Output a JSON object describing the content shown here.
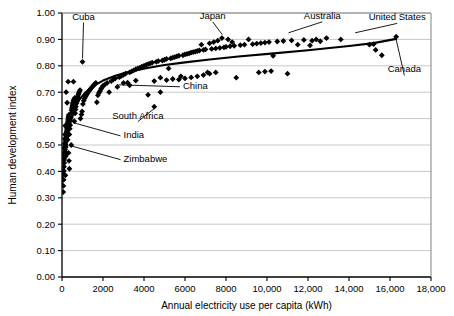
{
  "chart_data": {
    "type": "scatter",
    "title": "",
    "xlabel": "Annual electricity use per capita (kWh)",
    "ylabel": "Human development index",
    "xlim": [
      0,
      18000
    ],
    "ylim": [
      0.0,
      1.0
    ],
    "grid": true,
    "legend": null,
    "xticks": [
      "0",
      "2000",
      "4000",
      "6000",
      "8000",
      "10,000",
      "12,000",
      "14,000",
      "16,000",
      "18,000"
    ],
    "xtick_values": [
      0,
      2000,
      4000,
      6000,
      8000,
      10000,
      12000,
      14000,
      16000,
      18000
    ],
    "yticks": [
      "0.00",
      "0.10",
      "0.20",
      "0.30",
      "0.40",
      "0.50",
      "0.60",
      "0.70",
      "0.80",
      "0.90",
      "1.00"
    ],
    "ytick_values": [
      0.0,
      0.1,
      0.2,
      0.3,
      0.4,
      0.5,
      0.6,
      0.7,
      0.8,
      0.9,
      1.0
    ],
    "marker": "diamond",
    "marker_color": "#000000",
    "trend_color": "#000000",
    "grid_color": "#c8c8c8",
    "series": [
      {
        "name": "Countries",
        "points": [
          [
            60,
            0.322
          ],
          [
            70,
            0.345
          ],
          [
            80,
            0.368
          ],
          [
            75,
            0.392
          ],
          [
            90,
            0.402
          ],
          [
            100,
            0.418
          ],
          [
            110,
            0.432
          ],
          [
            95,
            0.445
          ],
          [
            120,
            0.452
          ],
          [
            130,
            0.462
          ],
          [
            105,
            0.47
          ],
          [
            140,
            0.476
          ],
          [
            150,
            0.483
          ],
          [
            115,
            0.489
          ],
          [
            160,
            0.495
          ],
          [
            170,
            0.5
          ],
          [
            125,
            0.505
          ],
          [
            180,
            0.511
          ],
          [
            190,
            0.518
          ],
          [
            135,
            0.523
          ],
          [
            200,
            0.528
          ],
          [
            210,
            0.534
          ],
          [
            145,
            0.54
          ],
          [
            220,
            0.545
          ],
          [
            230,
            0.551
          ],
          [
            240,
            0.557
          ],
          [
            250,
            0.562
          ],
          [
            260,
            0.568
          ],
          [
            155,
            0.573
          ],
          [
            270,
            0.578
          ],
          [
            280,
            0.584
          ],
          [
            290,
            0.59
          ],
          [
            300,
            0.596
          ],
          [
            310,
            0.602
          ],
          [
            320,
            0.608
          ],
          [
            330,
            0.614
          ],
          [
            165,
            0.385
          ],
          [
            175,
            0.457
          ],
          [
            185,
            0.492
          ],
          [
            195,
            0.466
          ],
          [
            450,
            0.5
          ],
          [
            600,
            0.59
          ],
          [
            360,
            0.54
          ],
          [
            380,
            0.562
          ],
          [
            400,
            0.575
          ],
          [
            420,
            0.604
          ],
          [
            440,
            0.62
          ],
          [
            460,
            0.632
          ],
          [
            480,
            0.64
          ],
          [
            500,
            0.648
          ],
          [
            520,
            0.655
          ],
          [
            540,
            0.661
          ],
          [
            560,
            0.667
          ],
          [
            580,
            0.672
          ],
          [
            620,
            0.678
          ],
          [
            640,
            0.62
          ],
          [
            660,
            0.634
          ],
          [
            680,
            0.645
          ],
          [
            700,
            0.658
          ],
          [
            720,
            0.666
          ],
          [
            740,
            0.673
          ],
          [
            760,
            0.68
          ],
          [
            780,
            0.686
          ],
          [
            800,
            0.692
          ],
          [
            820,
            0.697
          ],
          [
            850,
            0.703
          ],
          [
            880,
            0.708
          ],
          [
            560,
            0.74
          ],
          [
            300,
            0.74
          ],
          [
            1000,
            0.815
          ],
          [
            900,
            0.6
          ],
          [
            950,
            0.616
          ],
          [
            980,
            0.627
          ],
          [
            1020,
            0.655
          ],
          [
            1060,
            0.668
          ],
          [
            1100,
            0.676
          ],
          [
            1150,
            0.683
          ],
          [
            1200,
            0.69
          ],
          [
            1250,
            0.697
          ],
          [
            1300,
            0.703
          ],
          [
            1350,
            0.708
          ],
          [
            1400,
            0.713
          ],
          [
            1450,
            0.718
          ],
          [
            1500,
            0.722
          ],
          [
            1550,
            0.727
          ],
          [
            1600,
            0.731
          ],
          [
            1650,
            0.735
          ],
          [
            1700,
            0.662
          ],
          [
            1750,
            0.688
          ],
          [
            1800,
            0.697
          ],
          [
            1850,
            0.704
          ],
          [
            1900,
            0.712
          ],
          [
            1950,
            0.718
          ],
          [
            2000,
            0.724
          ],
          [
            2100,
            0.73
          ],
          [
            2200,
            0.735
          ],
          [
            2300,
            0.7
          ],
          [
            2400,
            0.742
          ],
          [
            2500,
            0.748
          ],
          [
            2600,
            0.752
          ],
          [
            2700,
            0.72
          ],
          [
            2800,
            0.757
          ],
          [
            2900,
            0.762
          ],
          [
            3000,
            0.766
          ],
          [
            3100,
            0.77
          ],
          [
            3200,
            0.736
          ],
          [
            3300,
            0.775
          ],
          [
            3400,
            0.779
          ],
          [
            3500,
            0.783
          ],
          [
            3600,
            0.787
          ],
          [
            3700,
            0.79
          ],
          [
            3800,
            0.793
          ],
          [
            3900,
            0.797
          ],
          [
            4000,
            0.8
          ],
          [
            4100,
            0.803
          ],
          [
            4200,
            0.806
          ],
          [
            4300,
            0.809
          ],
          [
            4400,
            0.812
          ],
          [
            4500,
            0.645
          ],
          [
            4600,
            0.815
          ],
          [
            4700,
            0.818
          ],
          [
            4800,
            0.755
          ],
          [
            4900,
            0.82
          ],
          [
            5000,
            0.823
          ],
          [
            5100,
            0.826
          ],
          [
            5200,
            0.79
          ],
          [
            5300,
            0.828
          ],
          [
            5400,
            0.831
          ],
          [
            5500,
            0.833
          ],
          [
            5600,
            0.836
          ],
          [
            5700,
            0.838
          ],
          [
            5800,
            0.76
          ],
          [
            5900,
            0.84
          ],
          [
            6000,
            0.843
          ],
          [
            6100,
            0.845
          ],
          [
            6200,
            0.847
          ],
          [
            6300,
            0.85
          ],
          [
            6400,
            0.852
          ],
          [
            6500,
            0.854
          ],
          [
            6600,
            0.856
          ],
          [
            6700,
            0.858
          ],
          [
            6800,
            0.88
          ],
          [
            6900,
            0.86
          ],
          [
            7000,
            0.862
          ],
          [
            7100,
            0.775
          ],
          [
            7200,
            0.885
          ],
          [
            7300,
            0.864
          ],
          [
            7400,
            0.89
          ],
          [
            7500,
            0.866
          ],
          [
            7600,
            0.895
          ],
          [
            7700,
            0.868
          ],
          [
            7800,
            0.905
          ],
          [
            7900,
            0.87
          ],
          [
            8000,
            0.872
          ],
          [
            8100,
            0.9
          ],
          [
            8200,
            0.874
          ],
          [
            8300,
            0.89
          ],
          [
            8400,
            0.876
          ],
          [
            8500,
            0.755
          ],
          [
            8700,
            0.878
          ],
          [
            8900,
            0.88
          ],
          [
            9100,
            0.9
          ],
          [
            9300,
            0.882
          ],
          [
            9500,
            0.884
          ],
          [
            9700,
            0.886
          ],
          [
            9900,
            0.888
          ],
          [
            10100,
            0.89
          ],
          [
            10300,
            0.838
          ],
          [
            10500,
            0.892
          ],
          [
            10800,
            0.894
          ],
          [
            11000,
            0.77
          ],
          [
            11200,
            0.896
          ],
          [
            11500,
            0.88
          ],
          [
            11800,
            0.898
          ],
          [
            12100,
            0.877
          ],
          [
            12400,
            0.9
          ],
          [
            4200,
            0.69
          ],
          [
            4500,
            0.742
          ],
          [
            4800,
            0.7
          ],
          [
            5100,
            0.746
          ],
          [
            5400,
            0.75
          ],
          [
            5700,
            0.748
          ],
          [
            6000,
            0.752
          ],
          [
            6300,
            0.756
          ],
          [
            6600,
            0.76
          ],
          [
            6900,
            0.765
          ],
          [
            7200,
            0.77
          ],
          [
            7500,
            0.775
          ],
          [
            3000,
            0.735
          ],
          [
            3300,
            0.726
          ],
          [
            3600,
            0.744
          ],
          [
            9600,
            0.775
          ],
          [
            9900,
            0.778
          ],
          [
            10200,
            0.78
          ],
          [
            12900,
            0.905
          ],
          [
            13600,
            0.9
          ],
          [
            15000,
            0.88
          ],
          [
            15200,
            0.882
          ],
          [
            15300,
            0.86
          ],
          [
            15600,
            0.84
          ],
          [
            16300,
            0.91
          ],
          [
            12200,
            0.895
          ],
          [
            12600,
            0.893
          ],
          [
            200,
            0.7
          ],
          [
            250,
            0.66
          ],
          [
            280,
            0.52
          ],
          [
            320,
            0.47
          ],
          [
            340,
            0.44
          ],
          [
            360,
            0.41
          ],
          [
            240,
            0.545
          ]
        ]
      }
    ],
    "trend_points": [
      [
        0,
        0.355
      ],
      [
        120,
        0.445
      ],
      [
        250,
        0.52
      ],
      [
        400,
        0.58
      ],
      [
        600,
        0.632
      ],
      [
        850,
        0.672
      ],
      [
        1150,
        0.7
      ],
      [
        1500,
        0.722
      ],
      [
        2000,
        0.744
      ],
      [
        2600,
        0.762
      ],
      [
        3300,
        0.778
      ],
      [
        4100,
        0.791
      ],
      [
        5000,
        0.803
      ],
      [
        6000,
        0.813
      ],
      [
        7200,
        0.824
      ],
      [
        8600,
        0.835
      ],
      [
        10200,
        0.846
      ],
      [
        12000,
        0.859
      ],
      [
        14000,
        0.875
      ],
      [
        15200,
        0.886
      ],
      [
        16300,
        0.902
      ]
    ],
    "annotations": [
      {
        "id": "cuba",
        "label": "Cuba",
        "text_x": 1050,
        "text_y": 0.975,
        "target_x": 1000,
        "target_y": 0.828,
        "anchor": "middle"
      },
      {
        "id": "japan",
        "label": "Japan",
        "text_x": 7350,
        "text_y": 0.978,
        "target_x": 7820,
        "target_y": 0.918,
        "anchor": "middle"
      },
      {
        "id": "australia",
        "label": "Australia",
        "text_x": 12700,
        "text_y": 0.978,
        "target_x": 11050,
        "target_y": 0.925,
        "anchor": "middle"
      },
      {
        "id": "united-states",
        "label": "United States",
        "text_x": 16350,
        "text_y": 0.972,
        "target_x": 14300,
        "target_y": 0.925,
        "anchor": "middle"
      },
      {
        "id": "canada",
        "label": "Canada",
        "text_x": 16700,
        "text_y": 0.775,
        "target_x": 16300,
        "target_y": 0.9,
        "anchor": "middle"
      },
      {
        "id": "china",
        "label": "China",
        "text_x": 5900,
        "text_y": 0.713,
        "target_x": 2750,
        "target_y": 0.728,
        "anchor": "start"
      },
      {
        "id": "south-africa",
        "label": "South Africa",
        "text_x": 3700,
        "text_y": 0.6,
        "target_x": 4500,
        "target_y": 0.638,
        "anchor": "middle"
      },
      {
        "id": "india",
        "label": "India",
        "text_x": 3000,
        "text_y": 0.527,
        "target_x": 620,
        "target_y": 0.583,
        "anchor": "start"
      },
      {
        "id": "zimbabwe",
        "label": "Zimbabwe",
        "text_x": 3000,
        "text_y": 0.437,
        "target_x": 470,
        "target_y": 0.496,
        "anchor": "start"
      }
    ]
  }
}
